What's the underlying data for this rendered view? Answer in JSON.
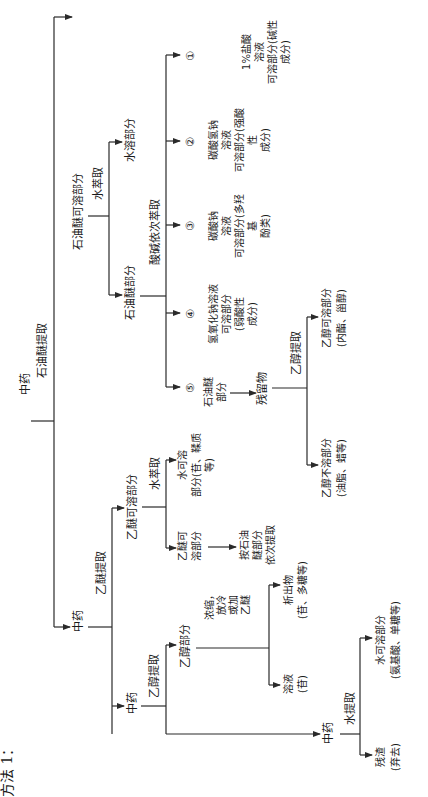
{
  "title": "方法 1：",
  "orientation": "rotated 90° clockwise (text reads bottom-to-top)",
  "scheme_1": {
    "root": "中药",
    "step1": "石油醚提取",
    "branch_soluble": {
      "label": "石油醚可溶部分",
      "step": "水萃取",
      "water_part": "水溶部分",
      "pe_part": "石油醚部分",
      "sequential": "酸碱依次萃取",
      "fractions": [
        {
          "num": "①",
          "lines": [
            "1%盐酸",
            "溶液",
            "可溶部分(碱性",
            "成分)"
          ]
        },
        {
          "num": "②",
          "lines": [
            "碳酸氢钠",
            "溶液",
            "可溶部分(强酸",
            "性",
            "成分)"
          ]
        },
        {
          "num": "③",
          "lines": [
            "碳酸钠",
            "溶液",
            "可溶部分(多羟",
            "基",
            "酚类)"
          ]
        },
        {
          "num": "④",
          "lines": [
            "氢氧化钠溶液",
            "可溶部分",
            "(弱酸性",
            "成分)"
          ]
        },
        {
          "num": "⑤",
          "lines": [
            "石油醚",
            "部分"
          ]
        }
      ]
    },
    "residue": {
      "label": "残留物",
      "step": "乙醇提取",
      "soluble": [
        "乙醇可溶部分",
        "(内酯、甾醇)"
      ],
      "insoluble": [
        "乙醇不溶部分",
        "(油脂、蜡等)"
      ]
    }
  },
  "scheme_2": {
    "root": "中药",
    "step1": "乙醚提取",
    "ether_soluble": "乙醚可溶部分",
    "water_step": "水萃取",
    "water_soluble": [
      "水可溶",
      "部分(苷、鞣质",
      "等)"
    ],
    "ether_soluble_part": [
      "乙醚可",
      "溶部分"
    ],
    "follow_up": [
      "按石油",
      "醚部分",
      "依次提取"
    ]
  },
  "scheme_3": {
    "root": "中药",
    "step1": "乙醇提取",
    "ethanol_part": "乙醇部分",
    "treatment": [
      "浓缩，",
      "放冷",
      "或加",
      "乙醚"
    ],
    "precipitate": [
      "析出物",
      "(苷、多糖等)"
    ],
    "solution": [
      "溶液",
      "(苷)"
    ]
  },
  "scheme_4": {
    "root": "中药",
    "step1": "水提取",
    "water_soluble": [
      "水可溶部分",
      "(氨基酸、单糖等)"
    ],
    "residue": [
      "残渣",
      "(弃去)"
    ]
  }
}
